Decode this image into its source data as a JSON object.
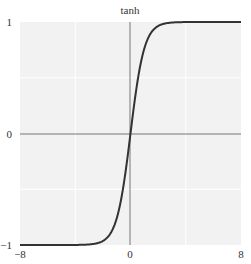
{
  "chart_data": {
    "type": "line",
    "title": "tanh",
    "xlabel": "",
    "ylabel": "",
    "xlim": [
      -8,
      8
    ],
    "ylim": [
      -1,
      1
    ],
    "x_ticks": [
      "−8",
      "0",
      "8"
    ],
    "y_ticks": [
      "−1",
      "0",
      "1"
    ],
    "grid": true,
    "series": [
      {
        "name": "tanh",
        "function": "tanh(x)",
        "x": [
          -8,
          -6,
          -4,
          -3,
          -2,
          -1.5,
          -1,
          -0.5,
          0,
          0.5,
          1,
          1.5,
          2,
          3,
          4,
          6,
          8
        ],
        "values": [
          -1.0,
          -1.0,
          -0.999,
          -0.995,
          -0.964,
          -0.905,
          -0.762,
          -0.462,
          0,
          0.462,
          0.762,
          0.905,
          0.964,
          0.995,
          0.999,
          1.0,
          1.0
        ]
      }
    ]
  },
  "colors": {
    "plot_background": "#f2f2f2",
    "grid": "#ffffff",
    "axis": "#777777",
    "curve": "#333333"
  }
}
